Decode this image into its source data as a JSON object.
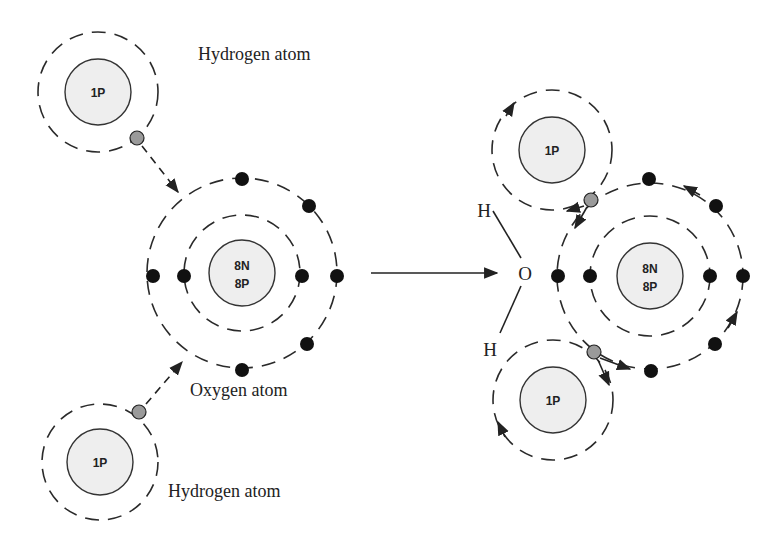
{
  "diagram": {
    "left": {
      "hydrogen_top": {
        "label": "Hydrogen atom",
        "nucleus": "1P"
      },
      "oxygen": {
        "label": "Oxygen atom",
        "nucleus_line1": "8N",
        "nucleus_line2": "8P"
      },
      "hydrogen_bottom": {
        "label": "Hydrogen atom",
        "nucleus": "1P"
      }
    },
    "right": {
      "hydrogen_top": {
        "nucleus": "1P"
      },
      "oxygen": {
        "nucleus_line1": "8N",
        "nucleus_line2": "8P"
      },
      "hydrogen_bottom": {
        "nucleus": "1P"
      },
      "formula": {
        "h_top": "H",
        "o": "O",
        "h_bottom": "H"
      }
    },
    "colors": {
      "electron": "#111111",
      "hydrogen_electron": "#9a9a9a",
      "nucleus_fill": "#eeeeee",
      "line": "#222222"
    }
  }
}
